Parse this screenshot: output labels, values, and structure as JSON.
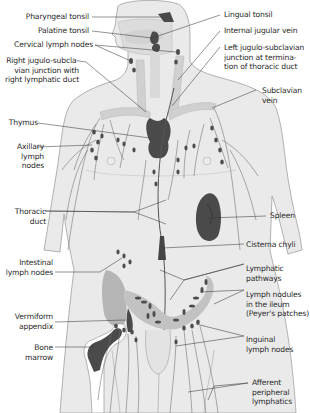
{
  "figure": {
    "colors": {
      "background": "#ffffff",
      "body_fill": "#e9e9e9",
      "body_outline": "#9a9a9a",
      "organ_dark": "#4a4a4a",
      "vessel_light": "#cfcfcf",
      "colon_fill": "#b5b5b5",
      "leader_line": "#3a3a3a",
      "text": "#2a2a2a"
    }
  },
  "labels_left": [
    {
      "id": "pharyngeal-tonsil",
      "lines": [
        "Pharyngeal tonsil"
      ]
    },
    {
      "id": "palatine-tonsil",
      "lines": [
        "Palatine tonsil"
      ]
    },
    {
      "id": "cervical-lymph-nodes",
      "lines": [
        "Cervical lymph nodes"
      ]
    },
    {
      "id": "right-jugulo-subclavian-junction",
      "lines": [
        "Right jugulo-subcla-",
        "vian junction with",
        "right lymphatic duct"
      ]
    },
    {
      "id": "thymus",
      "lines": [
        "Thymus"
      ]
    },
    {
      "id": "axillary-lymph-nodes",
      "lines": [
        "Axillary",
        "lymph",
        "nodes"
      ]
    },
    {
      "id": "thoracic-duct",
      "lines": [
        "Thoracic",
        "duct"
      ]
    },
    {
      "id": "intestinal-lymph-nodes",
      "lines": [
        "Intestinal",
        "lymph nodes"
      ]
    },
    {
      "id": "vermiform-appendix",
      "lines": [
        "Vermiform",
        "appendix"
      ]
    },
    {
      "id": "bone-marrow",
      "lines": [
        "Bone",
        "marrow"
      ]
    }
  ],
  "labels_right": [
    {
      "id": "lingual-tonsil",
      "lines": [
        "Lingual tonsil"
      ]
    },
    {
      "id": "internal-jugular-vein",
      "lines": [
        "Internal jugular vein"
      ]
    },
    {
      "id": "left-jugulo-subclavian-junction",
      "lines": [
        "Left jugulo-subclavian",
        "junction at termina-",
        "tion of thoracic duct"
      ]
    },
    {
      "id": "subclavian-vein",
      "lines": [
        "Subclavian",
        "vein"
      ]
    },
    {
      "id": "spleen",
      "lines": [
        "Spleen"
      ]
    },
    {
      "id": "cisterna-chyli",
      "lines": [
        "Cisterna chyli"
      ]
    },
    {
      "id": "lymphatic-pathways",
      "lines": [
        "Lymphatic",
        "pathways"
      ]
    },
    {
      "id": "lymph-nodules-ileum",
      "lines": [
        "Lymph nodules",
        "in the ileum",
        "(Peyer's patches)"
      ]
    },
    {
      "id": "inguinal-lymph-nodes",
      "lines": [
        "Inguinal",
        "lymph nodes"
      ]
    },
    {
      "id": "afferent-peripheral-lymphatics",
      "lines": [
        "Afferent",
        "peripheral",
        "lymphatics"
      ]
    }
  ]
}
